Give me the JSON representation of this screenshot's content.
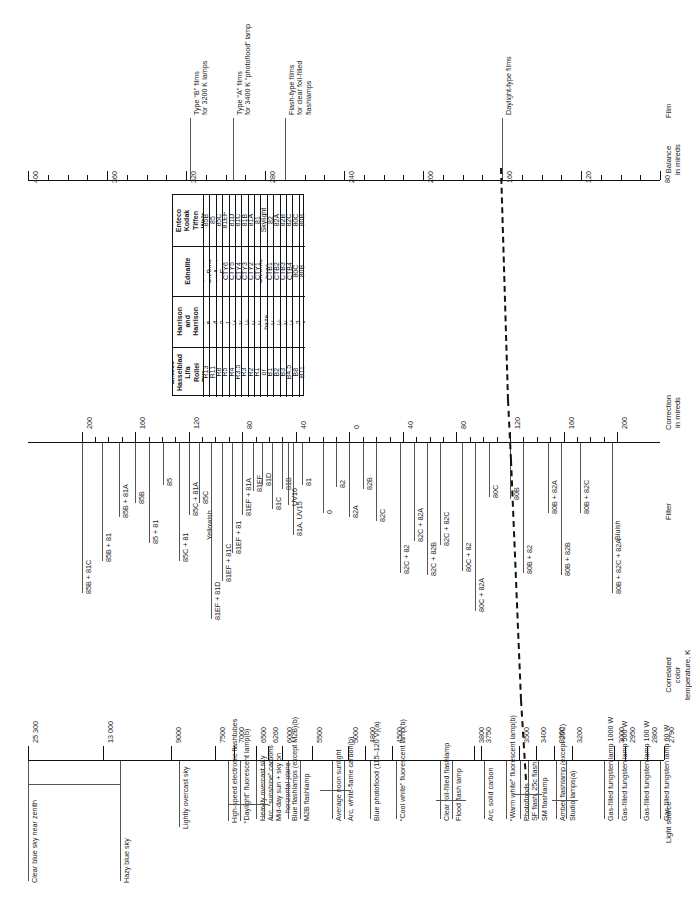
{
  "chart_data": {
    "type": "table",
    "orientation": "rotated-90-ccw",
    "columns": [
      {
        "key": "light_source",
        "label": "Light source"
      },
      {
        "key": "color_temp",
        "label": "Correlated\ncolor\ntemperature, K"
      },
      {
        "key": "filter",
        "label": "Filter"
      },
      {
        "key": "correction",
        "label": "Correction\nin mireds"
      },
      {
        "key": "balance",
        "label": "Balance\nin mireds"
      },
      {
        "key": "film",
        "label": "Film"
      }
    ],
    "correction_axis": {
      "label": "Correction in mireds",
      "ticks": [
        200,
        160,
        120,
        80,
        40,
        0,
        -40,
        -80,
        -120,
        -160,
        -200
      ],
      "tick_labels": [
        "200",
        "160",
        "120",
        "80",
        "40",
        "0",
        "40",
        "80",
        "120",
        "160",
        "200"
      ],
      "zones": [
        "Yellowish",
        "Bluish"
      ]
    },
    "balance_axis": {
      "label": "Balance in mireds",
      "ticks": [
        400,
        360,
        320,
        280,
        240,
        200,
        160,
        120,
        80
      ],
      "tick_labels": [
        "400",
        "360",
        "320",
        "280",
        "240",
        "200",
        "160",
        "120",
        "80"
      ]
    },
    "color_temp_axis": {
      "label": "Correlated color temperature, K",
      "ticks": [
        "25 300",
        "13 000",
        "9000",
        "7500",
        "7000",
        "6500",
        "6260",
        "6000",
        "5500",
        "5000",
        "4800",
        "4500",
        "3800",
        "3750",
        "3500",
        "3400",
        "3300",
        "3200",
        "3000",
        "2950",
        "2860",
        "2790"
      ]
    },
    "light_sources": [
      "Clear blue sky near zenith",
      "Hazy blue sky",
      "Lightly overcast sky",
      "High-speed electronic flashtubes",
      "“Daylight” fluorescent lamp(b)",
      "Heavily overcast sky",
      "Arc, “sunshine” carbons",
      "Mid-day sun + sky on horizontal plane",
      "Blue flashlamps (except M2B)(b)",
      "M2B flashlamp",
      "Average noon sunlight",
      "Arc, white-flame carbon(b)",
      "Blue photoflood (115–120 V)(a)",
      "“Cool white” fluorescent lamp(b)",
      "Clear foil-filled flashlamp",
      "Flood flash lamp",
      "Arc, solid carbon",
      "“Warm white” fluorescent lamp(b)",
      "Photofloods",
      "SF flash, 25c flash",
      "SM flashlamp",
      "Amber flashlamp (except 25C)",
      "Studio lamps(a)",
      "Gas-filled tungsten lamp 1000 W",
      "Gas-filled tungsten lamp 500 W",
      "Gas-filled tungsten lamp 100 W",
      "Gas-filled tungsten lamp 60 W"
    ],
    "film_notes": [
      "Type “B” films for 3200 K lamps",
      "Type “A” films for 3400 K “photoflood” lamp",
      "Flash-type films for clear foil-filled flashlamps",
      "Daylight-type films"
    ],
    "filter_labels": [
      "85B + 81C",
      "85B + 81",
      "85B + 81A",
      "85B",
      "85 + 81",
      "85",
      "85C + 81",
      "85C + 81A",
      "85C",
      "81EF + 81D",
      "81EF + 81C",
      "81EF + 81",
      "81EF + 81A",
      "81EF",
      "81D",
      "81C",
      "81B",
      "81A, UV15",
      "81",
      "UV16",
      "0",
      "82",
      "82A",
      "82B",
      "82C",
      "82C + 82",
      "82C + 82A",
      "82C + 82B",
      "82C + 82C",
      "80C + 82",
      "80C + 82A",
      "80C",
      "80B",
      "80B + 82",
      "80B + 82A",
      "80B + 82B",
      "80B + 82C",
      "80B + 82C + 82A"
    ],
    "filter_table": {
      "headers": [
        "Accura\nEnteco\nKodak\nTiffen\nWalz",
        "Ednalite",
        "Harrison\nand\nHarrison",
        "Enteco\nHasselblad\nLifa\nRollei\nTiffen"
      ],
      "rows": [
        [
          "85B",
          "Chrome B",
          "C-5",
          "R13"
        ],
        [
          "85",
          "Chrome A",
          "C-4",
          "R11"
        ],
        [
          "85C",
          "Chrome F",
          "C-2",
          "R8"
        ],
        [
          "81EF",
          "CTY6",
          "C-1",
          "R5"
        ],
        [
          "81D",
          "CTY5",
          "C-½",
          "R4"
        ],
        [
          "81C",
          "CTY4",
          "C-⅜",
          "R3.5"
        ],
        [
          "81B",
          "CTY3",
          "C-¼",
          "R3"
        ],
        [
          "81A",
          "CTY2",
          "C-⅛",
          "R2"
        ],
        [
          "81",
          "CTY1",
          "C-⅛",
          "R1"
        ],
        [
          "Skylight",
          "Chrome\nhaze",
          "UV-\nhaze",
          "R1 or 1.5"
        ],
        [
          "82",
          "CTB1",
          "B-⅛",
          "B1"
        ],
        [
          "82A",
          "CTB2",
          "B-¼",
          "B2"
        ],
        [
          "82B",
          "CTB3",
          "B-⅜",
          "B3"
        ],
        [
          "82C",
          "CTB4",
          "B-½",
          "B4.5"
        ],
        [
          "80C",
          "80C",
          "B-2",
          "B8"
        ],
        [
          "80B",
          "80B",
          "B-4",
          "B11"
        ]
      ]
    }
  },
  "headers": {
    "light_source": "Light source",
    "color_temperature": "Correlated\ncolor\ntemperature, K",
    "filter": "Filter",
    "correction": "Correction\nin mireds",
    "balance": "Balance\nin mireds",
    "film": "Film"
  },
  "zones": {
    "yellowish": "Yellowish",
    "bluish": "Bluish"
  }
}
